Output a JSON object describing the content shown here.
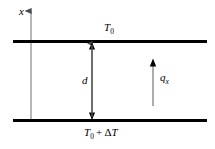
{
  "figure": {
    "background_color": "#ffffff",
    "line_color": "#000000",
    "axis_color": "#8c8c8c",
    "width": 215,
    "height": 149,
    "labels": {
      "axis_x": "x",
      "top_plate_temperature": "T0",
      "top_plate_temperature_display": "T",
      "top_plate_temperature_sub": "0",
      "gap_distance": "d",
      "heat_flux": "q",
      "heat_flux_sub": "x",
      "bottom_plate_temperature_base": "T",
      "bottom_plate_temperature_base_sub": "0",
      "bottom_plate_temperature_operator": "+",
      "bottom_plate_temperature_delta": "Δ",
      "bottom_plate_temperature_symbol": "T"
    },
    "elements": {
      "top_plate_label": "top-plate",
      "bottom_plate_label": "bottom-plate",
      "gap_arrow_label": "gap-dimension-arrow",
      "flux_arrow_label": "heat-flux-arrow",
      "axis_label": "x-axis"
    }
  }
}
